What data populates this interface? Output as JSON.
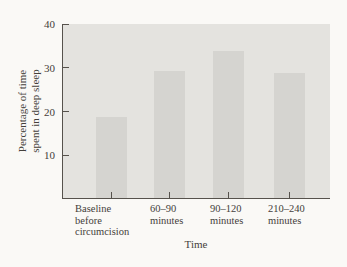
{
  "figure": {
    "background": "#faf9f6",
    "panel_color": "#e4e3df",
    "bar_color": "#d5d4d0",
    "axis_color": "#56524c",
    "text_color": "#44403a"
  },
  "chart_data": {
    "type": "bar",
    "title": "",
    "categories": [
      "Baseline before circumcision",
      "60–90 minutes",
      "90–120 minutes",
      "210–240 minutes"
    ],
    "category_lines": [
      [
        "Baseline",
        "before",
        "circumcision"
      ],
      [
        "60–90",
        "minutes"
      ],
      [
        "90–120",
        "minutes"
      ],
      [
        "210–240",
        "minutes"
      ]
    ],
    "values": [
      18.5,
      29,
      33.5,
      28.5
    ],
    "xlabel": "Time",
    "ylabel": "Percentage of time spent in deep sleep",
    "ylabel_lines": [
      "Percentage of time",
      "spent in deep sleep"
    ],
    "yticks": [
      10,
      20,
      30,
      40
    ],
    "ylim": [
      0,
      40
    ],
    "grid": false,
    "legend": null
  }
}
